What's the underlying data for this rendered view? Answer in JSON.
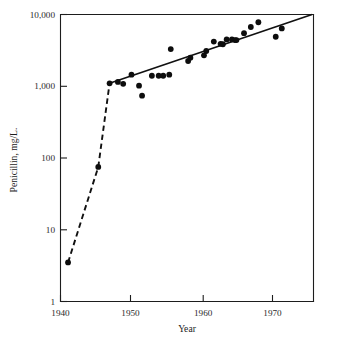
{
  "chart_data": {
    "type": "scatter",
    "title": "",
    "xlabel": "Year",
    "ylabel": "Penicillin, mg/L.",
    "xlim": [
      1940,
      1973.5
    ],
    "ylim": [
      1,
      10000
    ],
    "yscale": "log",
    "xscale": "linear",
    "grid": false,
    "legend": false,
    "x_ticks": [
      1940,
      1950,
      1960,
      1970
    ],
    "x_tick_labels": [
      "1940",
      "1950",
      "1960",
      "1970"
    ],
    "y_ticks": [
      1,
      10,
      100,
      1000,
      10000
    ],
    "y_tick_labels": [
      "1",
      "10",
      "100",
      "1,000",
      "10,000"
    ],
    "points": [
      {
        "x": 1941.0,
        "y": 3.5
      },
      {
        "x": 1945.0,
        "y": 75
      },
      {
        "x": 1946.5,
        "y": 1100
      },
      {
        "x": 1947.6,
        "y": 1150
      },
      {
        "x": 1948.3,
        "y": 1080
      },
      {
        "x": 1949.4,
        "y": 1450
      },
      {
        "x": 1950.4,
        "y": 1020
      },
      {
        "x": 1950.8,
        "y": 740
      },
      {
        "x": 1952.1,
        "y": 1400
      },
      {
        "x": 1953.0,
        "y": 1400
      },
      {
        "x": 1953.6,
        "y": 1400
      },
      {
        "x": 1954.4,
        "y": 1450
      },
      {
        "x": 1954.6,
        "y": 3300
      },
      {
        "x": 1956.9,
        "y": 2250
      },
      {
        "x": 1957.2,
        "y": 2500
      },
      {
        "x": 1959.0,
        "y": 2700
      },
      {
        "x": 1959.3,
        "y": 3100
      },
      {
        "x": 1960.3,
        "y": 4200
      },
      {
        "x": 1961.2,
        "y": 3900
      },
      {
        "x": 1961.5,
        "y": 3850
      },
      {
        "x": 1962.0,
        "y": 4500
      },
      {
        "x": 1962.7,
        "y": 4500
      },
      {
        "x": 1963.1,
        "y": 4400
      },
      {
        "x": 1963.3,
        "y": 4400
      },
      {
        "x": 1964.3,
        "y": 5500
      },
      {
        "x": 1965.2,
        "y": 6700
      },
      {
        "x": 1966.2,
        "y": 7800
      },
      {
        "x": 1968.5,
        "y": 4900
      },
      {
        "x": 1969.3,
        "y": 6400
      }
    ],
    "series": [
      {
        "name": "early-growth-dashed",
        "style": "dashed",
        "points": [
          {
            "x": 1941.0,
            "y": 3.5
          },
          {
            "x": 1945.0,
            "y": 75
          },
          {
            "x": 1946.5,
            "y": 1100
          }
        ]
      },
      {
        "name": "trend-solid",
        "style": "solid",
        "points": [
          {
            "x": 1946.5,
            "y": 1100
          },
          {
            "x": 1973.3,
            "y": 10000
          }
        ]
      }
    ]
  },
  "axes": {
    "x_title": "Year",
    "y_title": "Penicillin, mg/L.",
    "x_tick_labels": [
      "1940",
      "1950",
      "1960",
      "1970"
    ],
    "y_tick_labels": [
      "10,000",
      "1,000",
      "100",
      "10",
      "1"
    ]
  },
  "colors": {
    "marker": "#0d0d0d",
    "line": "#111111",
    "axis": "#1d1d1d",
    "background": "#ffffff"
  }
}
